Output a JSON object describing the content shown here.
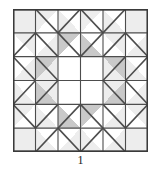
{
  "figure": {
    "caption": "1",
    "block_name": "eight-pointed-star-quilt-block"
  },
  "colors": {
    "background": "#ffffff",
    "light": "#ededed",
    "dark": "#c9c9c9",
    "white": "#ffffff",
    "line": "#4d4d4d",
    "border": "#3a3a3a",
    "caption_text": "#1a1a1a"
  },
  "grid": {
    "rows": 6,
    "cols": 6,
    "cell_size": 22.5,
    "origin_x": 0,
    "origin_y": 0
  },
  "legend": {
    "light_label": "light",
    "dark_label": "medium",
    "white_label": "background"
  },
  "chart_data": {
    "type": "heatmap",
    "xlabel": "",
    "ylabel": "",
    "categories": [
      "c1",
      "c2",
      "c3",
      "c4",
      "c5",
      "c6"
    ],
    "rows": [
      "r1",
      "r2",
      "r3",
      "r4",
      "r5",
      "r6"
    ],
    "patch_codes": [
      [
        "L",
        "TL/W",
        "W/TR",
        "TL/W",
        "W/TR",
        "L"
      ],
      [
        "TL/W",
        "W/TR",
        "D/W",
        "W/D",
        "TL/W",
        "W/TR"
      ],
      [
        "W/TL",
        "D/L",
        "W",
        "W",
        "L/D",
        "TR/W"
      ],
      [
        "W/TL",
        "D/L",
        "W",
        "W",
        "L/D",
        "TR/W"
      ],
      [
        "W/TL",
        "TR/W",
        "W/D",
        "D/W",
        "W/TL",
        "TR/W"
      ],
      [
        "L",
        "W/TR",
        "TL/W",
        "W/TR",
        "TL/W",
        "L"
      ]
    ],
    "cells": [
      {
        "r": 0,
        "c": 0,
        "kind": "solid",
        "fill": "light"
      },
      {
        "r": 0,
        "c": 1,
        "kind": "diag",
        "dir": "tlbr",
        "a": "light",
        "b": "white"
      },
      {
        "r": 0,
        "c": 2,
        "kind": "diag",
        "dir": "trbl",
        "a": "white",
        "b": "light"
      },
      {
        "r": 0,
        "c": 3,
        "kind": "diag",
        "dir": "tlbr",
        "a": "light",
        "b": "white"
      },
      {
        "r": 0,
        "c": 4,
        "kind": "diag",
        "dir": "trbl",
        "a": "white",
        "b": "light"
      },
      {
        "r": 0,
        "c": 5,
        "kind": "solid",
        "fill": "light"
      },
      {
        "r": 1,
        "c": 0,
        "kind": "diag",
        "dir": "trbl",
        "a": "light",
        "b": "white"
      },
      {
        "r": 1,
        "c": 1,
        "kind": "diag",
        "dir": "tlbr",
        "a": "white",
        "b": "light"
      },
      {
        "r": 1,
        "c": 2,
        "kind": "diag",
        "dir": "tlbr",
        "a": "dark",
        "b": "white"
      },
      {
        "r": 1,
        "c": 3,
        "kind": "diag",
        "dir": "trbl",
        "a": "white",
        "b": "dark"
      },
      {
        "r": 1,
        "c": 4,
        "kind": "diag",
        "dir": "trbl",
        "a": "light",
        "b": "white"
      },
      {
        "r": 1,
        "c": 5,
        "kind": "diag",
        "dir": "tlbr",
        "a": "white",
        "b": "light"
      },
      {
        "r": 2,
        "c": 0,
        "kind": "diag",
        "dir": "tlbr",
        "a": "white",
        "b": "light"
      },
      {
        "r": 2,
        "c": 1,
        "kind": "diag",
        "dir": "tlbr",
        "a": "dark",
        "b": "light"
      },
      {
        "r": 2,
        "c": 2,
        "kind": "solid",
        "fill": "white"
      },
      {
        "r": 2,
        "c": 3,
        "kind": "solid",
        "fill": "white"
      },
      {
        "r": 2,
        "c": 4,
        "kind": "diag",
        "dir": "trbl",
        "a": "dark",
        "b": "light"
      },
      {
        "r": 2,
        "c": 5,
        "kind": "diag",
        "dir": "trbl",
        "a": "white",
        "b": "light"
      },
      {
        "r": 3,
        "c": 0,
        "kind": "diag",
        "dir": "trbl",
        "a": "white",
        "b": "light"
      },
      {
        "r": 3,
        "c": 1,
        "kind": "diag",
        "dir": "trbl",
        "a": "light",
        "b": "dark"
      },
      {
        "r": 3,
        "c": 2,
        "kind": "solid",
        "fill": "white"
      },
      {
        "r": 3,
        "c": 3,
        "kind": "solid",
        "fill": "white"
      },
      {
        "r": 3,
        "c": 4,
        "kind": "diag",
        "dir": "tlbr",
        "a": "light",
        "b": "dark"
      },
      {
        "r": 3,
        "c": 5,
        "kind": "diag",
        "dir": "tlbr",
        "a": "white",
        "b": "light"
      },
      {
        "r": 4,
        "c": 0,
        "kind": "diag",
        "dir": "tlbr",
        "a": "light",
        "b": "white"
      },
      {
        "r": 4,
        "c": 1,
        "kind": "diag",
        "dir": "trbl",
        "a": "white",
        "b": "light"
      },
      {
        "r": 4,
        "c": 2,
        "kind": "diag",
        "dir": "trbl",
        "a": "white",
        "b": "dark"
      },
      {
        "r": 4,
        "c": 3,
        "kind": "diag",
        "dir": "tlbr",
        "a": "dark",
        "b": "white"
      },
      {
        "r": 4,
        "c": 4,
        "kind": "diag",
        "dir": "tlbr",
        "a": "white",
        "b": "light"
      },
      {
        "r": 4,
        "c": 5,
        "kind": "diag",
        "dir": "trbl",
        "a": "light",
        "b": "white"
      },
      {
        "r": 5,
        "c": 0,
        "kind": "solid",
        "fill": "light"
      },
      {
        "r": 5,
        "c": 1,
        "kind": "diag",
        "dir": "trbl",
        "a": "white",
        "b": "light"
      },
      {
        "r": 5,
        "c": 2,
        "kind": "diag",
        "dir": "tlbr",
        "a": "white",
        "b": "light"
      },
      {
        "r": 5,
        "c": 3,
        "kind": "diag",
        "dir": "trbl",
        "a": "white",
        "b": "light"
      },
      {
        "r": 5,
        "c": 4,
        "kind": "diag",
        "dir": "tlbr",
        "a": "white",
        "b": "light"
      },
      {
        "r": 5,
        "c": 5,
        "kind": "solid",
        "fill": "light"
      }
    ]
  }
}
